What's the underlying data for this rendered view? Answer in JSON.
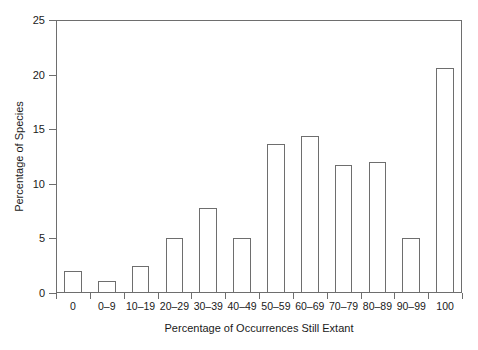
{
  "chart_data": {
    "type": "bar",
    "title": "",
    "subtitle": "",
    "xlabel": "Percentage of Occurrences Still Extant",
    "ylabel": "Percentage of Species",
    "categories": [
      "0",
      "0–9",
      "10–19",
      "20–29",
      "30–39",
      "40–49",
      "50–59",
      "60–69",
      "70–79",
      "80–89",
      "90–99",
      "100"
    ],
    "values": [
      2.0,
      1.1,
      2.5,
      5.0,
      7.8,
      5.0,
      13.6,
      14.4,
      11.7,
      12.0,
      5.0,
      20.6
    ],
    "ylim": [
      0,
      25
    ],
    "yticks": [
      0,
      5,
      10,
      15,
      20,
      25
    ],
    "ytick_labels": [
      "0",
      "5",
      "10",
      "15",
      "20",
      "25"
    ],
    "grid": false,
    "legend": false,
    "legend_position": "none",
    "bar_fill": "#ffffff",
    "bar_edge": "#6e6e6e",
    "frame_color": "#6e6e6e",
    "background": "#ffffff"
  }
}
